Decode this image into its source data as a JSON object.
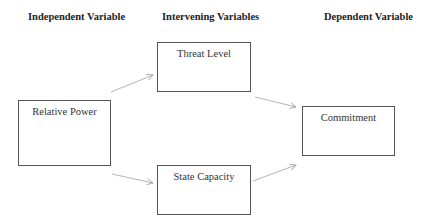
{
  "headers": {
    "independent": "Independent Variable",
    "intervening": "Intervening Variables",
    "dependent": "Dependent Variable"
  },
  "nodes": {
    "relative_power": "Relative Power",
    "threat_level": "Threat Level",
    "state_capacity": "State Capacity",
    "commitment": "Commitment"
  },
  "edges": [
    {
      "from": "Relative Power",
      "to": "Threat Level"
    },
    {
      "from": "Relative Power",
      "to": "State Capacity"
    },
    {
      "from": "Threat Level",
      "to": "Commitment"
    },
    {
      "from": "State Capacity",
      "to": "Commitment"
    }
  ],
  "colors": {
    "box_border": "#555555",
    "arrow": "#aaaaaa",
    "text": "#222222"
  }
}
